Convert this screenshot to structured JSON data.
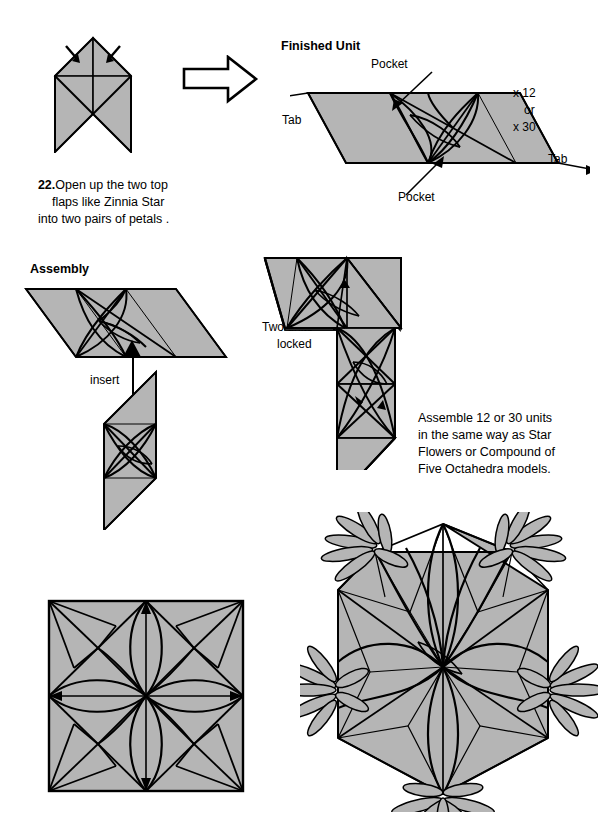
{
  "page": {
    "width": 599,
    "height": 826,
    "background": "#ffffff",
    "fill_gray": "#b5b5b5",
    "line_color": "#000000"
  },
  "step22": {
    "number": "22.",
    "line1": "Open up the two top",
    "line2": "flaps like Zinnia Star",
    "line3": "into two pairs of petals .",
    "arrow_icon": "big-arrow-right-icon"
  },
  "finished_unit": {
    "title": "Finished Unit",
    "pocket_top_label": "Pocket",
    "pocket_bottom_label": "Pocket",
    "tab_left_label": "Tab",
    "tab_right_label": "Tab",
    "count_line1": "x 12",
    "count_line2": "or",
    "count_line3": "x 30"
  },
  "assembly": {
    "title": "Assembly",
    "insert_label": "insert",
    "locked_line1": "Two units",
    "locked_line2": "locked",
    "note_line1": "Assemble 12 or 30 units",
    "note_line2": "in the same way as Star",
    "note_line3": "Flowers or Compound of",
    "note_line4": "Five Octahedra models."
  },
  "models": {
    "square_model_name": "twelve-unit-square-model",
    "ball_model_name": "thirty-unit-ball-model"
  }
}
